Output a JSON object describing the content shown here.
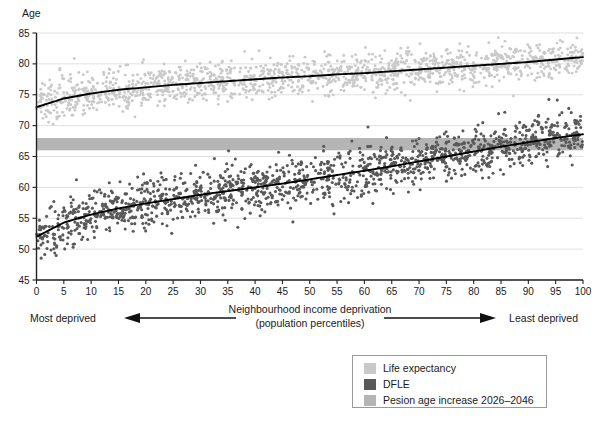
{
  "chart_data": {
    "type": "scatter",
    "title": "",
    "ylabel": "Age",
    "xlabel": "Neighbourhood income deprivation (population percentiles)",
    "xlabel_line1": "Neighbourhood income deprivation",
    "xlabel_line2": "(population percentiles)",
    "xlim": [
      0,
      100
    ],
    "ylim": [
      45,
      85
    ],
    "yticks": [
      45,
      50,
      55,
      60,
      65,
      70,
      75,
      80,
      85
    ],
    "xticks": [
      0,
      5,
      10,
      15,
      20,
      25,
      30,
      35,
      40,
      45,
      50,
      55,
      60,
      65,
      70,
      75,
      80,
      85,
      90,
      95,
      100
    ],
    "grid": true,
    "grid_axis": "y",
    "legend_position": "bottom-right",
    "annotations": {
      "left_label": "Most deprived",
      "right_label": "Least deprived",
      "left_arrow_direction": "left",
      "right_arrow_direction": "right"
    },
    "band": {
      "label": "Pesion age increase 2026–2046",
      "y_start": 66.0,
      "y_end": 68.0,
      "color": "#b5b5b5"
    },
    "series": [
      {
        "name": "Life expectancy",
        "color": "#c9c9c9",
        "marker": "circle",
        "trend_color": "#000000",
        "trend_x": [
          0,
          5,
          10,
          15,
          20,
          25,
          30,
          35,
          40,
          45,
          50,
          55,
          60,
          65,
          70,
          75,
          80,
          85,
          90,
          95,
          100
        ],
        "trend_y": [
          73.0,
          74.4,
          75.2,
          75.8,
          76.2,
          76.6,
          76.9,
          77.2,
          77.5,
          77.8,
          78.0,
          78.3,
          78.5,
          78.8,
          79.1,
          79.4,
          79.7,
          80.0,
          80.3,
          80.7,
          81.1
        ],
        "scatter_sd": 1.55,
        "n_points": 1500
      },
      {
        "name": "DFLE",
        "color": "#595959",
        "marker": "circle",
        "trend_color": "#000000",
        "trend_x": [
          0,
          5,
          10,
          15,
          20,
          25,
          30,
          35,
          40,
          45,
          50,
          55,
          60,
          65,
          70,
          75,
          80,
          85,
          90,
          95,
          100
        ],
        "trend_y": [
          52.0,
          54.3,
          55.6,
          56.6,
          57.4,
          58.1,
          58.8,
          59.4,
          60.0,
          60.6,
          61.3,
          62.0,
          62.7,
          63.4,
          64.2,
          65.0,
          65.8,
          66.6,
          67.3,
          68.0,
          68.6
        ],
        "scatter_sd": 1.95,
        "n_points": 1500
      }
    ]
  },
  "legend": {
    "items": [
      {
        "label": "Life expectancy",
        "color": "#c9c9c9"
      },
      {
        "label": "DFLE",
        "color": "#595959"
      },
      {
        "label": "Pesion age increase 2026–2046",
        "color": "#b5b5b5"
      }
    ]
  }
}
